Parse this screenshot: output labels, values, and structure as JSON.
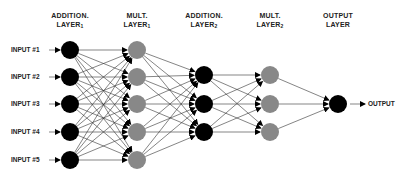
{
  "layers": [
    {
      "title": "ADDITION.",
      "subtitle": "LAYER",
      "sub": "1",
      "x": 70,
      "color": "#000000",
      "nodes": [
        50,
        77,
        104,
        132,
        160
      ]
    },
    {
      "title": "MULT.",
      "subtitle": "LAYER",
      "sub": "1",
      "x": 137,
      "color": "#888888",
      "nodes": [
        50,
        77,
        104,
        132,
        160
      ]
    },
    {
      "title": "ADDITION.",
      "subtitle": "LAYER",
      "sub": "2",
      "x": 204,
      "color": "#000000",
      "nodes": [
        75,
        104,
        132
      ]
    },
    {
      "title": "MULT.",
      "subtitle": "LAYER",
      "sub": "2",
      "x": 270,
      "color": "#888888",
      "nodes": [
        75,
        104,
        132
      ]
    },
    {
      "title": "OUTPUT",
      "subtitle": "LAYER",
      "sub": "",
      "x": 338,
      "color": "#000000",
      "nodes": [
        104
      ]
    }
  ],
  "inputs": [
    "INPUT #1",
    "INPUT #2",
    "INPUT #3",
    "INPUT #4",
    "INPUT #5"
  ],
  "output_label": "OUTPUT",
  "node_radius": 9
}
